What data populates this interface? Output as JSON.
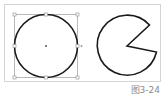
{
  "figure": {
    "caption": "图3-24",
    "panels": [
      {
        "name": "selected-circle",
        "shape": "circle",
        "selected": true,
        "stroke_color": "#1a1a1a",
        "handle_color": "#9a9a9a"
      },
      {
        "name": "pie-wedge-shape",
        "shape": "pac-man (circle with wedge removed)",
        "selected": false,
        "stroke_color": "#1a1a1a"
      }
    ]
  },
  "colors": {
    "frame_border": "#d4d4d4",
    "stroke": "#1a1a1a",
    "handles": "#9a9a9a",
    "caption": "#8a8a8a"
  }
}
